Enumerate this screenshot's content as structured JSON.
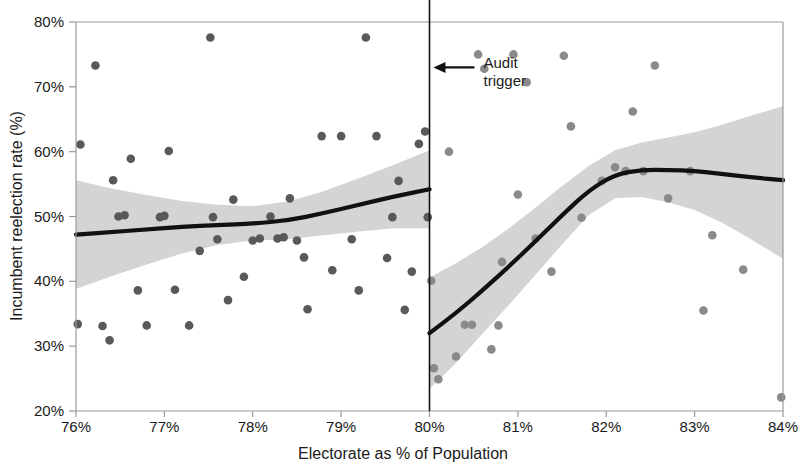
{
  "chart_data": {
    "type": "scatter",
    "title": "",
    "xlabel": "Electorate as % of Population",
    "ylabel": "Incumbent reelection rate (%)",
    "xlim": [
      76,
      84
    ],
    "ylim": [
      20,
      80
    ],
    "xticks": [
      "76%",
      "77%",
      "78%",
      "79%",
      "80%",
      "81%",
      "82%",
      "83%",
      "84%"
    ],
    "xtick_values": [
      76,
      77,
      78,
      79,
      80,
      81,
      82,
      83,
      84
    ],
    "yticks": [
      "20%",
      "30%",
      "40%",
      "50%",
      "60%",
      "70%",
      "80%"
    ],
    "ytick_values": [
      20,
      30,
      40,
      50,
      60,
      70,
      80
    ],
    "grid": false,
    "legend": "none",
    "annotations": [
      {
        "name": "audit-trigger",
        "label_line1": "Audit",
        "label_line2": "trigger",
        "x": 80,
        "y": 73,
        "arrow": "left",
        "cutoff_line_x": 80
      }
    ],
    "colors": {
      "points_left": "#595959",
      "points_right": "#8a8a8a",
      "fit_line": "#111111",
      "ci_band": "#d4d4d4",
      "axis": "#9a9a9a",
      "text": "#1a1a1a"
    },
    "series": [
      {
        "name": "Below audit trigger (76-80%)",
        "color": "#595959",
        "points": [
          [
            76.02,
            33.4
          ],
          [
            76.05,
            61.1
          ],
          [
            76.22,
            73.3
          ],
          [
            76.3,
            33.1
          ],
          [
            76.38,
            30.9
          ],
          [
            76.42,
            55.6
          ],
          [
            76.48,
            50.0
          ],
          [
            76.55,
            50.2
          ],
          [
            76.62,
            58.9
          ],
          [
            76.7,
            38.6
          ],
          [
            76.8,
            33.2
          ],
          [
            76.95,
            49.9
          ],
          [
            77.0,
            50.1
          ],
          [
            77.05,
            60.1
          ],
          [
            77.12,
            38.7
          ],
          [
            77.28,
            33.2
          ],
          [
            77.4,
            44.7
          ],
          [
            77.52,
            77.6
          ],
          [
            77.55,
            49.9
          ],
          [
            77.6,
            46.5
          ],
          [
            77.72,
            37.1
          ],
          [
            77.78,
            52.6
          ],
          [
            77.9,
            40.7
          ],
          [
            78.0,
            46.3
          ],
          [
            78.08,
            46.6
          ],
          [
            78.2,
            50.0
          ],
          [
            78.28,
            46.6
          ],
          [
            78.35,
            46.8
          ],
          [
            78.42,
            52.8
          ],
          [
            78.5,
            46.3
          ],
          [
            78.58,
            43.7
          ],
          [
            78.62,
            35.7
          ],
          [
            78.78,
            62.4
          ],
          [
            78.9,
            41.7
          ],
          [
            79.0,
            62.4
          ],
          [
            79.12,
            46.5
          ],
          [
            79.2,
            38.6
          ],
          [
            79.28,
            77.6
          ],
          [
            79.4,
            62.4
          ],
          [
            79.52,
            43.6
          ],
          [
            79.58,
            49.9
          ],
          [
            79.65,
            55.5
          ],
          [
            79.72,
            35.6
          ],
          [
            79.8,
            41.5
          ],
          [
            79.88,
            61.2
          ],
          [
            79.95,
            63.1
          ],
          [
            79.98,
            49.9
          ]
        ]
      },
      {
        "name": "Above audit trigger (80-84%)",
        "color": "#8a8a8a",
        "points": [
          [
            80.02,
            40.1
          ],
          [
            80.05,
            26.6
          ],
          [
            80.1,
            24.9
          ],
          [
            80.22,
            60.0
          ],
          [
            80.3,
            28.4
          ],
          [
            80.4,
            33.3
          ],
          [
            80.48,
            33.3
          ],
          [
            80.55,
            75.0
          ],
          [
            80.62,
            72.8
          ],
          [
            80.7,
            29.5
          ],
          [
            80.78,
            33.2
          ],
          [
            80.82,
            43.0
          ],
          [
            80.95,
            75.0
          ],
          [
            81.0,
            53.4
          ],
          [
            81.1,
            70.7
          ],
          [
            81.2,
            46.6
          ],
          [
            81.38,
            41.5
          ],
          [
            81.52,
            74.8
          ],
          [
            81.6,
            63.9
          ],
          [
            81.72,
            49.8
          ],
          [
            81.95,
            55.5
          ],
          [
            82.1,
            57.6
          ],
          [
            82.22,
            57.0
          ],
          [
            82.3,
            66.2
          ],
          [
            82.42,
            57.0
          ],
          [
            82.55,
            73.3
          ],
          [
            82.7,
            52.8
          ],
          [
            82.95,
            57.0
          ],
          [
            83.1,
            35.5
          ],
          [
            83.2,
            47.1
          ],
          [
            83.55,
            41.8
          ],
          [
            83.98,
            22.1
          ]
        ]
      }
    ],
    "fits": [
      {
        "name": "Local polynomial fit, left of cutoff",
        "panel": "left",
        "line": [
          [
            76.0,
            47.2
          ],
          [
            76.4,
            47.6
          ],
          [
            76.8,
            48.0
          ],
          [
            77.2,
            48.4
          ],
          [
            77.6,
            48.7
          ],
          [
            78.0,
            48.9
          ],
          [
            78.4,
            49.4
          ],
          [
            78.8,
            50.5
          ],
          [
            79.2,
            51.8
          ],
          [
            79.6,
            53.1
          ],
          [
            80.0,
            54.2
          ]
        ],
        "ci_upper": [
          [
            76.0,
            55.6
          ],
          [
            76.4,
            54.3
          ],
          [
            76.8,
            53.3
          ],
          [
            77.2,
            52.4
          ],
          [
            77.6,
            51.8
          ],
          [
            78.0,
            51.6
          ],
          [
            78.4,
            52.3
          ],
          [
            78.8,
            53.9
          ],
          [
            79.2,
            55.9
          ],
          [
            79.6,
            58.0
          ],
          [
            80.0,
            60.2
          ]
        ],
        "ci_lower": [
          [
            76.0,
            38.8
          ],
          [
            76.4,
            40.8
          ],
          [
            76.8,
            42.6
          ],
          [
            77.2,
            44.3
          ],
          [
            77.6,
            45.6
          ],
          [
            78.0,
            46.3
          ],
          [
            78.4,
            46.5
          ],
          [
            78.8,
            47.1
          ],
          [
            79.2,
            47.7
          ],
          [
            79.6,
            48.2
          ],
          [
            80.0,
            48.2
          ]
        ]
      },
      {
        "name": "Local polynomial fit, right of cutoff",
        "panel": "right",
        "line": [
          [
            80.0,
            32.0
          ],
          [
            80.3,
            35.1
          ],
          [
            80.6,
            38.6
          ],
          [
            80.9,
            42.3
          ],
          [
            81.2,
            46.2
          ],
          [
            81.5,
            50.2
          ],
          [
            81.8,
            54.0
          ],
          [
            82.1,
            56.5
          ],
          [
            82.4,
            57.2
          ],
          [
            82.7,
            57.2
          ],
          [
            83.0,
            57.0
          ],
          [
            83.3,
            56.6
          ],
          [
            83.6,
            56.1
          ],
          [
            84.0,
            55.6
          ]
        ],
        "ci_upper": [
          [
            80.0,
            40.6
          ],
          [
            80.3,
            42.8
          ],
          [
            80.6,
            45.3
          ],
          [
            80.9,
            48.2
          ],
          [
            81.2,
            51.4
          ],
          [
            81.5,
            54.7
          ],
          [
            81.8,
            57.8
          ],
          [
            82.1,
            60.2
          ],
          [
            82.4,
            61.4
          ],
          [
            82.7,
            62.2
          ],
          [
            83.0,
            63.0
          ],
          [
            83.3,
            64.1
          ],
          [
            83.6,
            65.4
          ],
          [
            84.0,
            67.0
          ]
        ],
        "ci_lower": [
          [
            80.0,
            23.4
          ],
          [
            80.3,
            27.4
          ],
          [
            80.6,
            31.9
          ],
          [
            80.9,
            36.4
          ],
          [
            81.2,
            41.0
          ],
          [
            81.5,
            45.7
          ],
          [
            81.8,
            50.2
          ],
          [
            82.1,
            52.8
          ],
          [
            82.4,
            53.0
          ],
          [
            82.7,
            52.2
          ],
          [
            83.0,
            51.0
          ],
          [
            83.3,
            49.1
          ],
          [
            83.6,
            46.8
          ],
          [
            84.0,
            43.5
          ]
        ]
      }
    ]
  }
}
